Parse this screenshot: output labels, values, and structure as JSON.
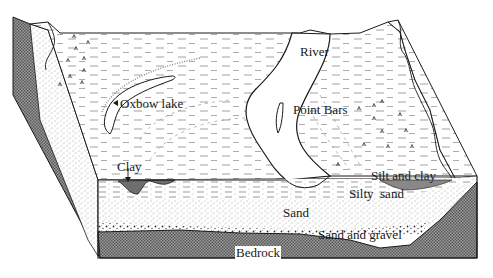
{
  "diagram": {
    "type": "block-diagram",
    "labels": {
      "river": "River",
      "oxbow_lake": "Oxbow lake",
      "point_bars": "Point Bars",
      "clay": "Clay",
      "silt_and_clay": "Silt and clay",
      "silty_sand": "Silty  sand",
      "sand": "Sand",
      "sand_and_gravel": "Sand and gravel",
      "bedrock": "Bedrock"
    },
    "colors": {
      "background": "#ffffff",
      "line": "#1a1a1a",
      "bedrock_fill": "#8c8c8c",
      "clay_fill": "#6e6e6e",
      "sand_dots": "#555555"
    }
  }
}
